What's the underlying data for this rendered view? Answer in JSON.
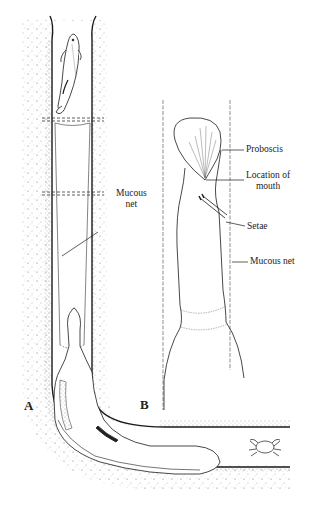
{
  "figure": {
    "panels": [
      {
        "id": "A",
        "label": "A"
      },
      {
        "id": "B",
        "label": "B"
      }
    ],
    "panel_a_labels": {
      "mucous_net": "Mucous\nnet"
    },
    "panel_b_labels": {
      "proboscis": "Proboscis",
      "location_of_mouth": "Location of\nmouth",
      "setae": "Setae",
      "mucous_net": "Mucous net"
    },
    "organisms": [
      "fish-in-burrow-opening",
      "worm",
      "crab-in-burrow"
    ],
    "colors": {
      "ink": "#1a1a1a",
      "background": "#ffffff",
      "sediment_stipple": "#555555"
    }
  }
}
